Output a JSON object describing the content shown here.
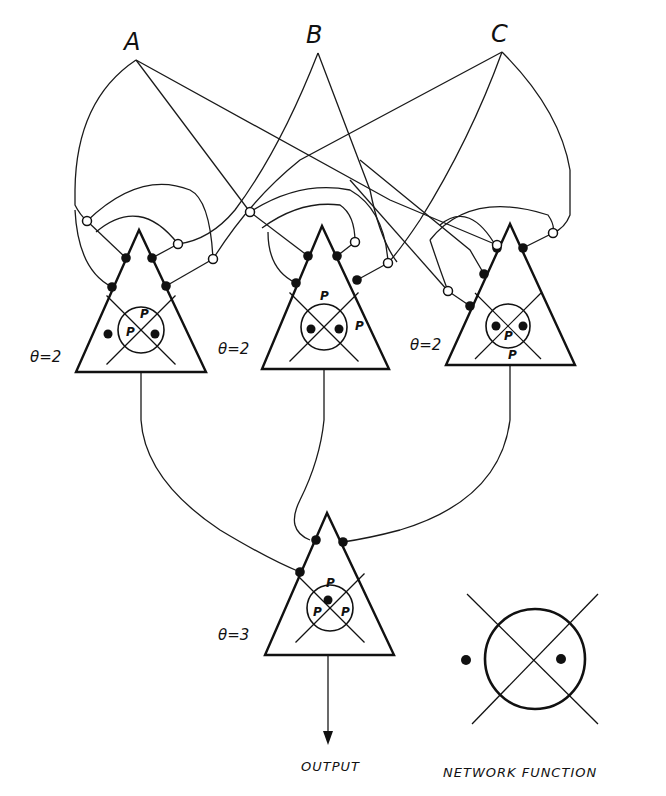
{
  "inputs": [
    {
      "id": "A",
      "label": "A",
      "x": 136,
      "y": 60,
      "lx": 124,
      "ly": 50
    },
    {
      "id": "B",
      "label": "B",
      "x": 318,
      "y": 53,
      "lx": 306,
      "ly": 43
    },
    {
      "id": "C",
      "label": "C",
      "x": 502,
      "y": 52,
      "lx": 491,
      "ly": 42
    }
  ],
  "units": [
    {
      "id": "unit-1",
      "theta_label": "θ=2",
      "theta_x": 30,
      "theta_y": 362,
      "apex": [
        139,
        230
      ],
      "left": [
        76,
        372
      ],
      "right": [
        206,
        372
      ],
      "circle": {
        "cx": 141,
        "cy": 330,
        "r": 23
      },
      "p_labels": [
        {
          "text": "P",
          "x": 140,
          "y": 318
        },
        {
          "text": "P",
          "x": 126,
          "y": 336
        }
      ],
      "dots": [
        [
          108,
          334
        ],
        [
          155,
          334
        ]
      ]
    },
    {
      "id": "unit-2",
      "theta_label": "θ=2",
      "theta_x": 218,
      "theta_y": 354,
      "apex": [
        322,
        226
      ],
      "left": [
        262,
        369
      ],
      "right": [
        389,
        369
      ],
      "circle": {
        "cx": 324,
        "cy": 327,
        "r": 23
      },
      "p_labels": [
        {
          "text": "P",
          "x": 320,
          "y": 300
        },
        {
          "text": "P",
          "x": 355,
          "y": 330
        }
      ],
      "dots": [
        [
          311,
          329
        ],
        [
          339,
          329
        ]
      ]
    },
    {
      "id": "unit-3",
      "theta_label": "θ=2",
      "theta_x": 410,
      "theta_y": 350,
      "apex": [
        510,
        224
      ],
      "left": [
        446,
        365
      ],
      "right": [
        575,
        365
      ],
      "circle": {
        "cx": 508,
        "cy": 326,
        "r": 22
      },
      "p_labels": [
        {
          "text": "P",
          "x": 504,
          "y": 340
        },
        {
          "text": "P",
          "x": 508,
          "y": 359
        }
      ],
      "dots": [
        [
          496,
          326
        ],
        [
          523,
          326
        ]
      ]
    }
  ],
  "output_unit": {
    "id": "unit-out",
    "theta_label": "θ=3",
    "theta_x": 218,
    "theta_y": 640,
    "apex": [
      327,
      513
    ],
    "left": [
      265,
      655
    ],
    "right": [
      394,
      655
    ],
    "circle": {
      "cx": 330,
      "cy": 608,
      "r": 23
    },
    "p_labels": [
      {
        "text": "P",
        "x": 326,
        "y": 587
      },
      {
        "text": "P",
        "x": 313,
        "y": 616
      },
      {
        "text": "P",
        "x": 341,
        "y": 616
      }
    ],
    "dots": [
      [
        328,
        600
      ]
    ]
  },
  "output": {
    "label": "OUTPUT",
    "x": 301,
    "y": 771,
    "arrow_from": [
      328,
      655
    ],
    "arrow_to": [
      328,
      745
    ]
  },
  "legend": {
    "caption": "NETWORK FUNCTION",
    "caption_x": 443,
    "caption_y": 777,
    "circle": {
      "cx": 535,
      "cy": 659,
      "r": 50
    },
    "dots": [
      [
        466,
        660
      ],
      [
        561,
        659
      ]
    ]
  },
  "excitatory_synapses": [
    [
      126,
      258
    ],
    [
      152,
      258
    ],
    [
      112,
      287
    ],
    [
      166,
      286
    ],
    [
      308,
      256
    ],
    [
      337,
      256
    ],
    [
      296,
      283
    ],
    [
      357,
      280
    ],
    [
      497,
      248
    ],
    [
      523,
      248
    ],
    [
      484,
      274
    ],
    [
      470,
      306
    ]
  ],
  "inhibitory_synapses": [
    [
      87,
      221
    ],
    [
      178,
      244
    ],
    [
      213,
      259
    ],
    [
      250,
      212
    ],
    [
      355,
      242
    ],
    [
      388,
      263
    ],
    [
      448,
      291
    ],
    [
      553,
      233
    ],
    [
      497,
      245
    ]
  ],
  "wires": [
    "M136 60 Q76 100 75 190 L75 205 Q80 215 87 221",
    "M87 221 L126 258",
    "M75 210 Q78 270 112 287",
    "M136 60 L250 212",
    "M136 60 L390 200 L497 245",
    "M318 53 Q280 150 235 210 Q210 240 178 244",
    "M318 53 L370 190 Q380 240 397 262",
    "M502 52 L300 160 Q250 200 213 259",
    "M502 52 Q470 140 420 220 Q400 250 388 263",
    "M502 52 Q560 110 570 170 L570 215 Q565 228 553 233",
    "M87 221 Q140 170 190 190 Q210 200 213 259",
    "M96 232 Q140 195 178 244",
    "M213 259 L166 286",
    "M178 244 L152 258",
    "M250 212 L308 256",
    "M250 212 Q300 180 350 190 Q385 210 388 263",
    "M262 228 Q300 200 340 205 Q355 215 355 242",
    "M355 242 L337 256",
    "M388 263 L357 280",
    "M268 232 Q268 270 296 283",
    "M360 160 L470 250 L484 274",
    "M440 225 Q470 200 497 248",
    "M553 233 L523 248",
    "M430 240 Q470 190 548 215 Q555 225 553 233",
    "M448 291 L470 306",
    "M448 291 Q440 270 430 240",
    "M350 180 L448 291",
    "M141 372 L141 420 Q145 480 220 530 Q270 560 300 572",
    "M324 369 L324 420 Q320 460 300 500 Q285 530 310 540",
    "M510 365 L510 420 Q500 500 400 530 Q370 538 343 542"
  ],
  "output_unit_synapses": [
    [
      300,
      572
    ],
    [
      316,
      540
    ],
    [
      343,
      542
    ]
  ]
}
